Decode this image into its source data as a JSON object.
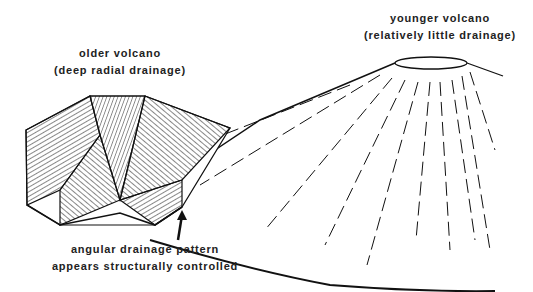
{
  "labels": {
    "older": {
      "line1": "older volcano",
      "line2": "(deep radial drainage)"
    },
    "younger": {
      "line1": "younger volcano",
      "line2": "(relatively little drainage)"
    },
    "angular": {
      "line1": "angular drainage pattern",
      "line2": "appears structurally controlled"
    }
  },
  "colors": {
    "ink": "#111111",
    "background": "#ffffff"
  }
}
